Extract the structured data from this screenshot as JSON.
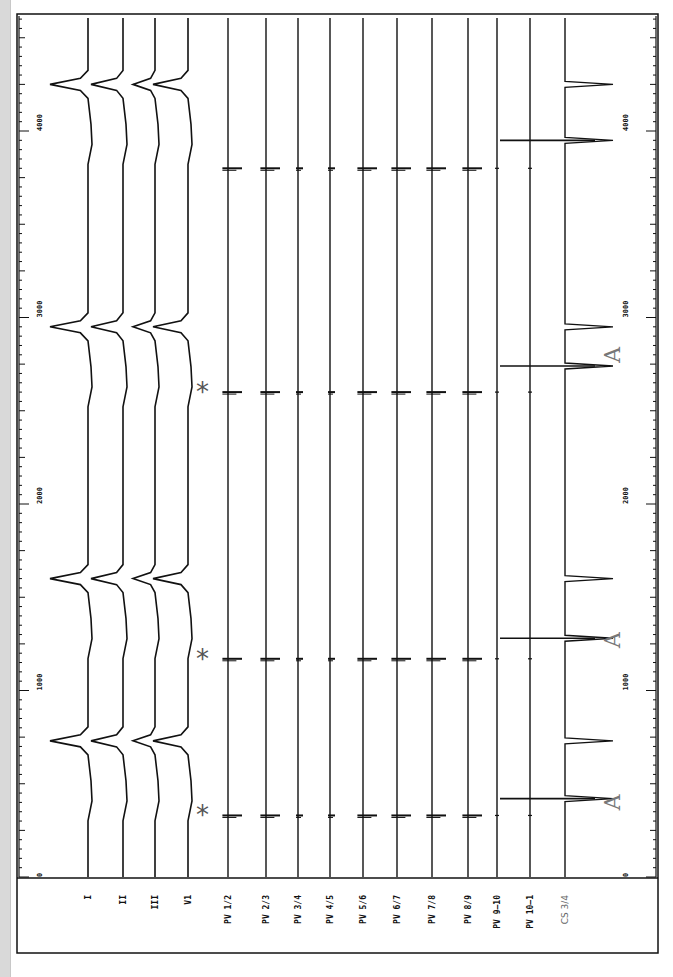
{
  "figure": {
    "type": "intracardiac electrogram recording (rotated 90°)",
    "time_axis": {
      "unit": "ms",
      "ticks": [
        "0",
        "1000",
        "2000",
        "3000",
        "4000"
      ],
      "tick_values": [
        0,
        1000,
        2000,
        3000,
        4000
      ],
      "range": [
        0,
        4500
      ]
    },
    "channels": [
      {
        "id": "I",
        "label": "I",
        "group": "surface"
      },
      {
        "id": "II",
        "label": "II",
        "group": "surface"
      },
      {
        "id": "III",
        "label": "III",
        "group": "surface"
      },
      {
        "id": "V1",
        "label": "V1",
        "group": "surface"
      },
      {
        "id": "PV12",
        "label": "PV 1/2",
        "group": "pv"
      },
      {
        "id": "PV23",
        "label": "PV 2/3",
        "group": "pv"
      },
      {
        "id": "PV34",
        "label": "PV 3/4",
        "group": "pv"
      },
      {
        "id": "PV45",
        "label": "PV 4/5",
        "group": "pv"
      },
      {
        "id": "PV56",
        "label": "PV 5/6",
        "group": "pv"
      },
      {
        "id": "PV67",
        "label": "PV 6/7",
        "group": "pv"
      },
      {
        "id": "PV78",
        "label": "PV 7/8",
        "group": "pv"
      },
      {
        "id": "PV89",
        "label": "PV 8/9",
        "group": "pv"
      },
      {
        "id": "PV910",
        "label": "PV 9–10",
        "group": "pv"
      },
      {
        "id": "PV101",
        "label": "PV 10–1",
        "group": "pv"
      },
      {
        "id": "CS34",
        "label": "CS 3/4",
        "group": "cs"
      }
    ],
    "annotations": {
      "star_symbol": "*",
      "atrial_symbol": "A",
      "star_times_ms": [
        330,
        1170,
        2600
      ],
      "atrial_times_ms": [
        400,
        1270,
        2800
      ]
    },
    "events_ms": {
      "qrs": [
        730,
        1600,
        2950,
        4250
      ],
      "pv_spikes": [
        330,
        1170,
        2600,
        3800
      ],
      "cs_atrial": [
        420,
        1280,
        2740,
        3950
      ]
    }
  }
}
